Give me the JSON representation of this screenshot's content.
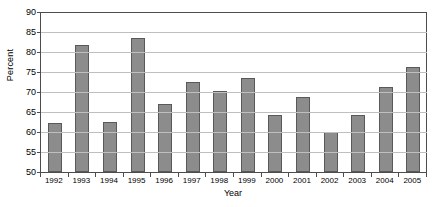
{
  "chart_data": {
    "type": "bar",
    "title": "",
    "xlabel": "Year",
    "ylabel": "Percent",
    "ylim": [
      50,
      90
    ],
    "ytick_step": 5,
    "yticks": [
      90,
      85,
      80,
      75,
      70,
      65,
      60,
      55,
      50
    ],
    "grid": true,
    "legend": null,
    "categories": [
      "1992",
      "1993",
      "1994",
      "1995",
      "1996",
      "1997",
      "1998",
      "1999",
      "2000",
      "2001",
      "2002",
      "2003",
      "2004",
      "2005"
    ],
    "values": [
      62.2,
      81.7,
      62.4,
      83.4,
      66.9,
      72.5,
      70.2,
      73.4,
      64.2,
      68.8,
      60.0,
      64.3,
      71.2,
      76.2
    ],
    "bar_color": "#8c8c8c",
    "bar_edge_color": "#595959",
    "gridline_color": "#bfbfbf",
    "axis_color": "#4d4d4d"
  },
  "caption": ""
}
